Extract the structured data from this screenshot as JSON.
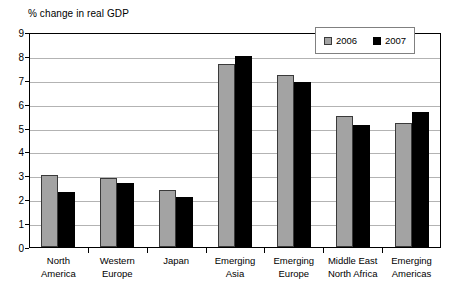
{
  "chart_data": {
    "type": "bar",
    "title": "% change in real GDP",
    "xlabel": "",
    "ylabel": "",
    "ylim": [
      0,
      9
    ],
    "ytick_labels": [
      "0",
      "1",
      "2",
      "3",
      "4",
      "5",
      "6",
      "7",
      "8",
      "9"
    ],
    "grid": true,
    "legend_position": "top-right",
    "categories": [
      "North America",
      "Western Europe",
      "Japan",
      "Emerging Asia",
      "Emerging Europe",
      "Middle East North Africa",
      "Emerging Americas"
    ],
    "category_lines": [
      [
        "North",
        "America"
      ],
      [
        "Western",
        "Europe"
      ],
      [
        "Japan",
        ""
      ],
      [
        "Emerging",
        "Asia"
      ],
      [
        "Emerging",
        "Europe"
      ],
      [
        "Middle East",
        "North Africa"
      ],
      [
        "Emerging",
        "Americas"
      ]
    ],
    "series": [
      {
        "name": "2006",
        "color": "#a3a3a3",
        "values": [
          3.0,
          2.9,
          2.4,
          7.65,
          7.2,
          5.5,
          5.2
        ]
      },
      {
        "name": "2007",
        "color": "#000000",
        "values": [
          2.3,
          2.7,
          2.1,
          8.0,
          6.9,
          5.1,
          5.65
        ]
      }
    ]
  },
  "legend": {
    "items": [
      {
        "label": "2006"
      },
      {
        "label": "2007"
      }
    ]
  }
}
